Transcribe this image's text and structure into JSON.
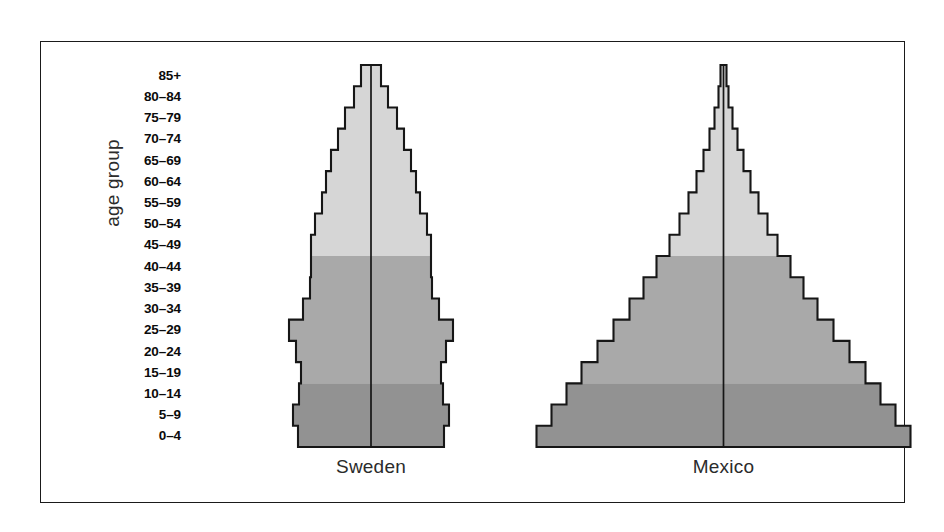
{
  "axis": {
    "y_axis_label": "age group"
  },
  "chart_data": {
    "type": "bar",
    "chart_subtype": "population-pyramid",
    "title": "",
    "xlabel": "",
    "ylabel": "age group",
    "orientation": "horizontal-mirrored",
    "grid": false,
    "legend": "none",
    "axis_label": "age group",
    "categories": [
      "85+",
      "80–84",
      "75–79",
      "70–74",
      "65–69",
      "60–64",
      "55–59",
      "50–54",
      "45–49",
      "40–44",
      "35–39",
      "30–34",
      "25–29",
      "20–24",
      "15–19",
      "10–14",
      "5–9",
      "0–4"
    ],
    "bands": [
      {
        "name": "older",
        "color": "#d6d6d6",
        "categories": [
          "85+",
          "80–84",
          "75–79",
          "70–74",
          "65–69",
          "60–64",
          "55–59",
          "50–54",
          "45–49"
        ]
      },
      {
        "name": "middle",
        "color": "#a9a9a9",
        "categories": [
          "40–44",
          "35–39",
          "30–34",
          "25–29",
          "20–24",
          "15–19"
        ]
      },
      {
        "name": "young",
        "color": "#929292",
        "categories": [
          "10–14",
          "5–9",
          "0–4"
        ]
      }
    ],
    "panels": [
      {
        "name": "Sweden",
        "label": "Sweden",
        "half_widths_px": [
          10,
          17,
          26,
          33,
          40,
          45,
          49,
          56,
          60,
          60,
          61,
          68,
          82,
          75,
          70,
          72,
          78,
          73
        ],
        "values_percent": [
          1.2,
          2.0,
          3.1,
          3.9,
          4.8,
          5.4,
          5.9,
          6.7,
          7.2,
          7.2,
          7.3,
          8.1,
          9.8,
          9.0,
          8.4,
          8.6,
          9.3,
          8.7
        ]
      },
      {
        "name": "Mexico",
        "label": "Mexico",
        "half_widths_px": [
          3,
          5,
          9,
          14,
          20,
          27,
          35,
          44,
          54,
          67,
          80,
          94,
          110,
          126,
          142,
          157,
          172,
          187
        ],
        "values_percent": [
          0.2,
          0.3,
          0.5,
          0.8,
          1.1,
          1.5,
          1.9,
          2.4,
          3.0,
          3.7,
          4.4,
          5.2,
          6.1,
          7.0,
          7.9,
          8.7,
          9.5,
          10.3
        ]
      }
    ]
  },
  "captions": {
    "sweden": "Sweden",
    "mexico": "Mexico"
  },
  "colors": {
    "band_light": "#d6d6d6",
    "band_mid": "#a9a9a9",
    "band_dark": "#929292",
    "outline": "#161616",
    "frame": "#1a1a1a",
    "background": "#ffffff"
  }
}
